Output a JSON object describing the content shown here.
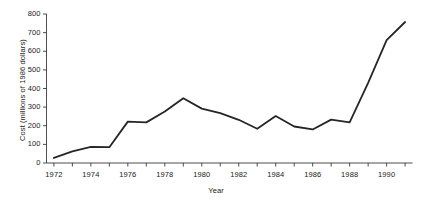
{
  "chart_data": {
    "type": "line",
    "title": "",
    "xlabel": "Year",
    "ylabel": "Cost (millions of 1986 dollars)",
    "xlim": [
      1971.6,
      1991.4
    ],
    "ylim": [
      0,
      800
    ],
    "xticks": [
      1972,
      1974,
      1976,
      1978,
      1980,
      1982,
      1984,
      1986,
      1988,
      1990
    ],
    "xtick_labels": [
      "1972",
      "1974",
      "1976",
      "1978",
      "1980",
      "1982",
      "1984",
      "1986",
      "1988",
      "1990"
    ],
    "yticks": [
      0,
      100,
      200,
      300,
      400,
      500,
      600,
      700,
      800
    ],
    "ytick_labels": [
      "0",
      "100",
      "200",
      "300",
      "400",
      "500",
      "600",
      "700",
      "800"
    ],
    "grid": false,
    "legend": false,
    "line_color": "#262626",
    "line_width": 1.8,
    "background_color": "#ffffff",
    "x": [
      1972,
      1973,
      1974,
      1975,
      1976,
      1977,
      1978,
      1979,
      1980,
      1981,
      1982,
      1983,
      1984,
      1985,
      1986,
      1987,
      1988,
      1989,
      1990,
      1991
    ],
    "values": [
      27,
      62,
      86,
      85,
      222,
      218,
      276,
      348,
      292,
      268,
      232,
      184,
      252,
      196,
      180,
      233,
      218,
      430,
      660,
      757
    ],
    "series": [
      {
        "name": "Cost",
        "values": [
          27,
          62,
          86,
          85,
          222,
          218,
          276,
          348,
          292,
          268,
          232,
          184,
          252,
          196,
          180,
          233,
          218,
          430,
          660,
          757
        ]
      }
    ]
  },
  "axes": {
    "y_axis_name": "y-axis",
    "x_axis_name": "x-axis"
  }
}
